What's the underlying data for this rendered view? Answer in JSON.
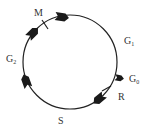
{
  "diagram": {
    "title": "",
    "type": "cell-cycle",
    "labels": {
      "M": "M",
      "G1": "G",
      "G1_sub": "1",
      "G0": "G",
      "G0_sub": "0",
      "R": "R",
      "S": "S",
      "G2": "G",
      "G2_sub": "2"
    },
    "colors": {
      "line": "#222222",
      "arrow": "#1a1a1a",
      "text": "#333333"
    }
  }
}
